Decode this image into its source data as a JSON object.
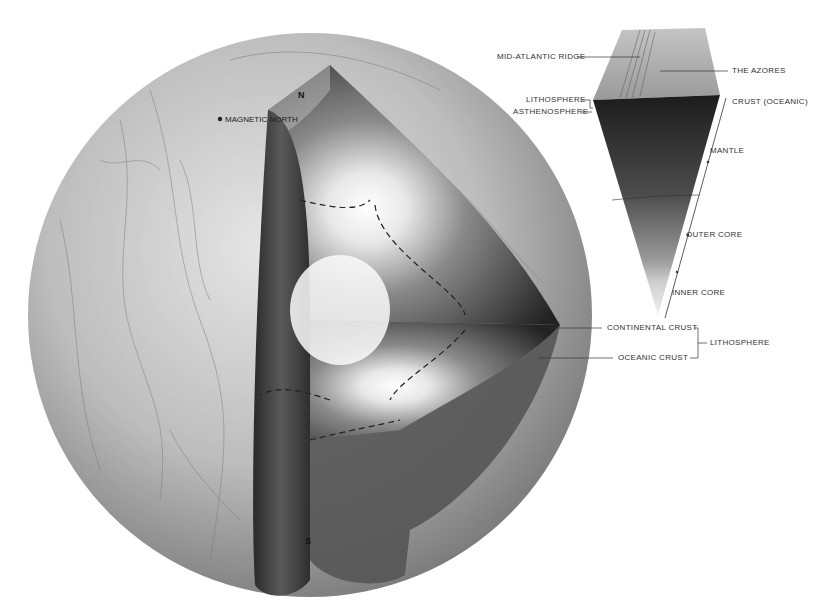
{
  "globe_labels": {
    "magnetic_north": "MAGNETIC NORTH",
    "north_pole": "N",
    "south_pole": "S"
  },
  "wedge_labels": {
    "mid_atlantic_ridge": "MID-ATLANTIC RIDGE",
    "azores": "THE AZORES",
    "lithosphere": "LITHOSPHERE",
    "asthenosphere": "ASTHENOSPHERE",
    "crust_oceanic": "CRUST (OCEANIC)",
    "mantle": "MANTLE",
    "outer_core": "OUTER CORE",
    "inner_core": "INNER CORE"
  },
  "crust_labels": {
    "continental_crust": "CONTINENTAL CRUST",
    "oceanic_crust": "OCEANIC CRUST",
    "lithosphere_group": "LITHOSPHERE"
  },
  "colors": {
    "background": "#ffffff",
    "label_text": "#333333",
    "globe_light": "#d8d8d8",
    "globe_dark": "#6a6a6a",
    "mantle_dark": "#2a2a2a",
    "core_light": "#f2f2f2"
  }
}
